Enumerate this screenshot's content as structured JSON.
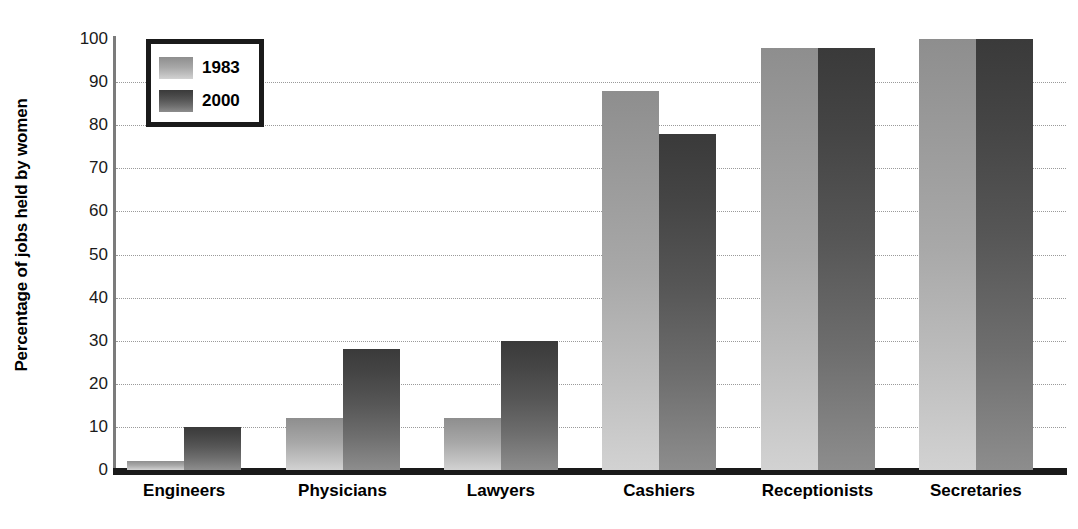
{
  "chart_data": {
    "type": "bar",
    "title": "",
    "xlabel": "",
    "ylabel": "Percentage of jobs held by women",
    "ylim": [
      0,
      100
    ],
    "yticks": [
      0,
      10,
      20,
      30,
      40,
      50,
      60,
      70,
      80,
      90,
      100
    ],
    "grid": true,
    "legend_position": "top-left",
    "categories": [
      "Engineers",
      "Physicians",
      "Lawyers",
      "Cashiers",
      "Receptionists",
      "Secretaries"
    ],
    "series": [
      {
        "name": "1983",
        "color": "#a8a8a8",
        "values": [
          2,
          12,
          12,
          88,
          98,
          100
        ]
      },
      {
        "name": "2000",
        "color": "#565656",
        "values": [
          10,
          28,
          30,
          78,
          98,
          100
        ]
      }
    ]
  },
  "axis": {
    "y_title": "Percentage of jobs held by women",
    "tick_labels": [
      "100",
      "90",
      "80",
      "70",
      "60",
      "50",
      "40",
      "30",
      "20",
      "10",
      "0"
    ],
    "tick_values": [
      100,
      90,
      80,
      70,
      60,
      50,
      40,
      30,
      20,
      10,
      0
    ]
  },
  "legend": {
    "items": [
      {
        "label": "1983",
        "swatch": "light-gray-gradient-swatch"
      },
      {
        "label": "2000",
        "swatch": "dark-gray-gradient-swatch"
      }
    ]
  },
  "colors": {
    "series_1983": "#a8a8a8",
    "series_2000": "#565656",
    "axis": "#1a1a1a",
    "gridline": "#9a9a9a",
    "background": "#ffffff"
  }
}
